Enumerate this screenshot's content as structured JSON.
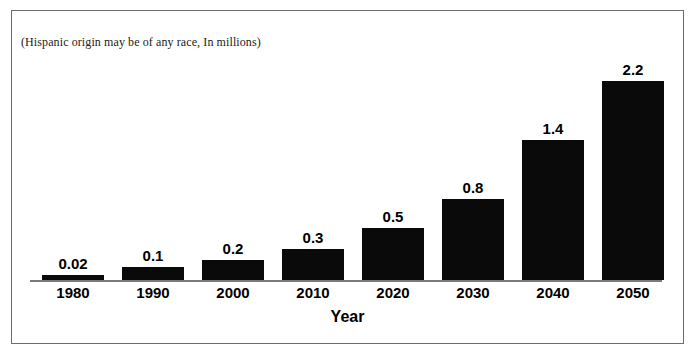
{
  "chart_data": {
    "type": "bar",
    "title": "",
    "subtitle": "(Hispanic origin may be of any race, In millions)",
    "categories": [
      "1980",
      "1990",
      "2000",
      "2010",
      "2020",
      "2030",
      "2040",
      "2050"
    ],
    "values": [
      0.02,
      0.1,
      0.2,
      0.3,
      0.5,
      0.8,
      1.4,
      2.2
    ],
    "value_labels": [
      "0.02",
      "0.1",
      "0.2",
      "0.3",
      "0.5",
      "0.8",
      "1.4",
      "2.2"
    ],
    "bar_pixel_heights": [
      5,
      13,
      20,
      31,
      52,
      81,
      140,
      199
    ],
    "xlabel": "Year",
    "ylabel": "",
    "ylim": [
      0,
      2.2
    ],
    "grid": false,
    "legend": null,
    "series": [
      {
        "name": "Population",
        "values": [
          0.02,
          0.1,
          0.2,
          0.3,
          0.5,
          0.8,
          1.4,
          2.2
        ]
      }
    ],
    "colors": {
      "bar": "#0a0a0a",
      "axis": "#7a7a7a",
      "frame": "#6d6d6d",
      "text": "#000000",
      "background": "#ffffff"
    }
  },
  "figure": {
    "caption": "(Hispanic origin may be of any race, In millions)",
    "axis_title": "Year"
  }
}
